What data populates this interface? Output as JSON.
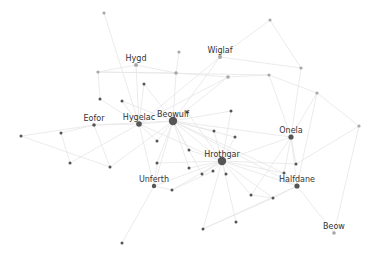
{
  "diagram": {
    "type": "network-graph",
    "title": "",
    "colors": {
      "background": "#ffffff",
      "edge": "#e6e6e6",
      "node_dark": "#555555",
      "node_light": "#a8a8a8",
      "label": "#333333"
    },
    "nodes": [
      {
        "id": "beowulf",
        "label": "Beowulf",
        "x": 173,
        "y": 121,
        "r": 4.2,
        "tone": "dark"
      },
      {
        "id": "hrothgar",
        "label": "Hrothgar",
        "x": 222,
        "y": 161,
        "r": 4.2,
        "tone": "dark"
      },
      {
        "id": "hygelac",
        "label": "Hygelac",
        "x": 139,
        "y": 124,
        "r": 2.8,
        "tone": "dark"
      },
      {
        "id": "onela",
        "label": "Onela",
        "x": 291,
        "y": 137,
        "r": 2.6,
        "tone": "dark"
      },
      {
        "id": "halfdane",
        "label": "Halfdane",
        "x": 297,
        "y": 186,
        "r": 2.6,
        "tone": "dark"
      },
      {
        "id": "unferth",
        "label": "Unferth",
        "x": 154,
        "y": 186,
        "r": 2.2,
        "tone": "dark"
      },
      {
        "id": "eofor",
        "label": "Eofor",
        "x": 94,
        "y": 125,
        "r": 1.8,
        "tone": "dark"
      },
      {
        "id": "hygd",
        "label": "Hygd",
        "x": 136,
        "y": 65,
        "r": 2.0,
        "tone": "light"
      },
      {
        "id": "wiglaf",
        "label": "Wiglaf",
        "x": 220,
        "y": 57,
        "r": 2.0,
        "tone": "light"
      },
      {
        "id": "beow",
        "label": "Beow",
        "x": 334,
        "y": 233,
        "r": 1.8,
        "tone": "light"
      },
      {
        "id": "n1",
        "label": "",
        "x": 104,
        "y": 13,
        "r": 1.6,
        "tone": "light"
      },
      {
        "id": "n2",
        "label": "",
        "x": 270,
        "y": 20,
        "r": 1.6,
        "tone": "light"
      },
      {
        "id": "n3",
        "label": "",
        "x": 179,
        "y": 52,
        "r": 1.6,
        "tone": "light"
      },
      {
        "id": "n4",
        "label": "",
        "x": 98,
        "y": 72,
        "r": 1.6,
        "tone": "light"
      },
      {
        "id": "n5",
        "label": "",
        "x": 176,
        "y": 73,
        "r": 1.8,
        "tone": "light"
      },
      {
        "id": "n6",
        "label": "",
        "x": 228,
        "y": 77,
        "r": 1.8,
        "tone": "light"
      },
      {
        "id": "n7",
        "label": "",
        "x": 269,
        "y": 75,
        "r": 1.6,
        "tone": "light"
      },
      {
        "id": "n8",
        "label": "",
        "x": 301,
        "y": 68,
        "r": 1.6,
        "tone": "light"
      },
      {
        "id": "n9",
        "label": "",
        "x": 317,
        "y": 93,
        "r": 1.6,
        "tone": "light"
      },
      {
        "id": "n10",
        "label": "",
        "x": 359,
        "y": 126,
        "r": 1.6,
        "tone": "light"
      },
      {
        "id": "n11",
        "label": "",
        "x": 144,
        "y": 84,
        "r": 1.5,
        "tone": "dark"
      },
      {
        "id": "n12",
        "label": "",
        "x": 100,
        "y": 99,
        "r": 1.5,
        "tone": "dark"
      },
      {
        "id": "n13",
        "label": "",
        "x": 122,
        "y": 101,
        "r": 1.5,
        "tone": "dark"
      },
      {
        "id": "n14",
        "label": "",
        "x": 187,
        "y": 112,
        "r": 1.5,
        "tone": "dark"
      },
      {
        "id": "n15",
        "label": "",
        "x": 231,
        "y": 111,
        "r": 1.5,
        "tone": "dark"
      },
      {
        "id": "n16",
        "label": "",
        "x": 21,
        "y": 136,
        "r": 1.5,
        "tone": "dark"
      },
      {
        "id": "n17",
        "label": "",
        "x": 61,
        "y": 133,
        "r": 1.5,
        "tone": "dark"
      },
      {
        "id": "n18",
        "label": "",
        "x": 70,
        "y": 163,
        "r": 1.5,
        "tone": "dark"
      },
      {
        "id": "n19",
        "label": "",
        "x": 110,
        "y": 167,
        "r": 1.5,
        "tone": "dark"
      },
      {
        "id": "n20",
        "label": "",
        "x": 157,
        "y": 141,
        "r": 1.5,
        "tone": "dark"
      },
      {
        "id": "n21",
        "label": "",
        "x": 189,
        "y": 150,
        "r": 1.5,
        "tone": "dark"
      },
      {
        "id": "n22",
        "label": "",
        "x": 235,
        "y": 137,
        "r": 1.5,
        "tone": "dark"
      },
      {
        "id": "n23",
        "label": "",
        "x": 214,
        "y": 131,
        "r": 1.5,
        "tone": "dark"
      },
      {
        "id": "n24",
        "label": "",
        "x": 157,
        "y": 163,
        "r": 1.5,
        "tone": "dark"
      },
      {
        "id": "n25",
        "label": "",
        "x": 189,
        "y": 168,
        "r": 1.5,
        "tone": "dark"
      },
      {
        "id": "n26",
        "label": "",
        "x": 202,
        "y": 174,
        "r": 1.5,
        "tone": "dark"
      },
      {
        "id": "n27",
        "label": "",
        "x": 213,
        "y": 171,
        "r": 1.5,
        "tone": "dark"
      },
      {
        "id": "n28",
        "label": "",
        "x": 172,
        "y": 190,
        "r": 1.5,
        "tone": "dark"
      },
      {
        "id": "n29",
        "label": "",
        "x": 233,
        "y": 137,
        "r": 0,
        "tone": "dark"
      },
      {
        "id": "n30",
        "label": "",
        "x": 226,
        "y": 174,
        "r": 1.5,
        "tone": "dark"
      },
      {
        "id": "n31",
        "label": "",
        "x": 284,
        "y": 173,
        "r": 1.5,
        "tone": "dark"
      },
      {
        "id": "n32",
        "label": "",
        "x": 296,
        "y": 164,
        "r": 1.5,
        "tone": "dark"
      },
      {
        "id": "n33",
        "label": "",
        "x": 251,
        "y": 195,
        "r": 1.5,
        "tone": "dark"
      },
      {
        "id": "n34",
        "label": "",
        "x": 273,
        "y": 198,
        "r": 1.5,
        "tone": "dark"
      },
      {
        "id": "n35",
        "label": "",
        "x": 236,
        "y": 222,
        "r": 1.5,
        "tone": "dark"
      },
      {
        "id": "n36",
        "label": "",
        "x": 203,
        "y": 229,
        "r": 1.5,
        "tone": "dark"
      },
      {
        "id": "n37",
        "label": "",
        "x": 122,
        "y": 243,
        "r": 1.5,
        "tone": "dark"
      }
    ],
    "edges": [
      [
        "n1",
        "hygelac"
      ],
      [
        "n2",
        "wiglaf"
      ],
      [
        "n2",
        "n8"
      ],
      [
        "wiglaf",
        "beowulf"
      ],
      [
        "wiglaf",
        "n8"
      ],
      [
        "wiglaf",
        "hygelac"
      ],
      [
        "n3",
        "n5"
      ],
      [
        "hygd",
        "hygelac"
      ],
      [
        "hygd",
        "n4"
      ],
      [
        "hygd",
        "n5"
      ],
      [
        "n4",
        "n5"
      ],
      [
        "n4",
        "n12"
      ],
      [
        "n4",
        "n7"
      ],
      [
        "n5",
        "n6"
      ],
      [
        "n5",
        "beowulf"
      ],
      [
        "n6",
        "n7"
      ],
      [
        "n6",
        "beowulf"
      ],
      [
        "n6",
        "hygelac"
      ],
      [
        "n7",
        "n9"
      ],
      [
        "n7",
        "onela"
      ],
      [
        "n8",
        "onela"
      ],
      [
        "n9",
        "onela"
      ],
      [
        "n9",
        "n10"
      ],
      [
        "n9",
        "halfdane"
      ],
      [
        "n10",
        "n32"
      ],
      [
        "n11",
        "beowulf"
      ],
      [
        "n11",
        "hygelac"
      ],
      [
        "n12",
        "hygelac"
      ],
      [
        "n13",
        "beowulf"
      ],
      [
        "n13",
        "hygelac"
      ],
      [
        "n14",
        "beowulf"
      ],
      [
        "n14",
        "hrothgar"
      ],
      [
        "n15",
        "beowulf"
      ],
      [
        "n15",
        "hrothgar"
      ],
      [
        "eofor",
        "hygelac"
      ],
      [
        "eofor",
        "n16"
      ],
      [
        "eofor",
        "n17"
      ],
      [
        "eofor",
        "n19"
      ],
      [
        "eofor",
        "beowulf"
      ],
      [
        "n17",
        "n18"
      ],
      [
        "n16",
        "n19"
      ],
      [
        "n18",
        "hygelac"
      ],
      [
        "n19",
        "beowulf"
      ],
      [
        "hygelac",
        "beowulf"
      ],
      [
        "hygelac",
        "hrothgar"
      ],
      [
        "hygelac",
        "n20"
      ],
      [
        "hygelac",
        "unferth"
      ],
      [
        "beowulf",
        "hrothgar"
      ],
      [
        "beowulf",
        "n20"
      ],
      [
        "beowulf",
        "n21"
      ],
      [
        "beowulf",
        "n22"
      ],
      [
        "beowulf",
        "n23"
      ],
      [
        "beowulf",
        "unferth"
      ],
      [
        "beowulf",
        "n24"
      ],
      [
        "beowulf",
        "n25"
      ],
      [
        "beowulf",
        "n26"
      ],
      [
        "beowulf",
        "onela"
      ],
      [
        "beowulf",
        "halfdane"
      ],
      [
        "beowulf",
        "n31"
      ],
      [
        "hrothgar",
        "n21"
      ],
      [
        "hrothgar",
        "n22"
      ],
      [
        "hrothgar",
        "n23"
      ],
      [
        "hrothgar",
        "n24"
      ],
      [
        "hrothgar",
        "n25"
      ],
      [
        "hrothgar",
        "n26"
      ],
      [
        "hrothgar",
        "n27"
      ],
      [
        "hrothgar",
        "n28"
      ],
      [
        "hrothgar",
        "unferth"
      ],
      [
        "hrothgar",
        "onela"
      ],
      [
        "hrothgar",
        "halfdane"
      ],
      [
        "hrothgar",
        "n30"
      ],
      [
        "hrothgar",
        "n31"
      ],
      [
        "hrothgar",
        "n33"
      ],
      [
        "hrothgar",
        "n34"
      ],
      [
        "hrothgar",
        "n35"
      ],
      [
        "hrothgar",
        "n36"
      ],
      [
        "hrothgar",
        "n32"
      ],
      [
        "onela",
        "halfdane"
      ],
      [
        "onela",
        "n32"
      ],
      [
        "onela",
        "n33"
      ],
      [
        "onela",
        "n31"
      ],
      [
        "halfdane",
        "n34"
      ],
      [
        "halfdane",
        "n31"
      ],
      [
        "halfdane",
        "beow"
      ],
      [
        "halfdane",
        "n36"
      ],
      [
        "beow",
        "n10"
      ],
      [
        "unferth",
        "n37"
      ],
      [
        "unferth",
        "n28"
      ],
      [
        "unferth",
        "n24"
      ],
      [
        "n28",
        "n27"
      ],
      [
        "n33",
        "n34"
      ],
      [
        "n36",
        "n34"
      ]
    ]
  }
}
